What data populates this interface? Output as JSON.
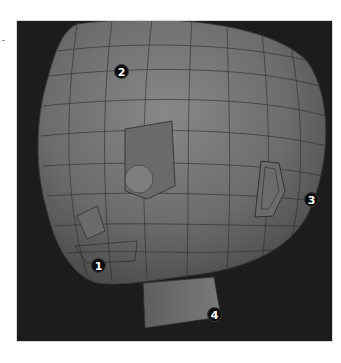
{
  "figure": {
    "background_color": "#1c1c1c",
    "mesh_color": "#6e6e6e",
    "wire_color": "#2a2a2a",
    "callouts": [
      {
        "label": "1",
        "x": 90,
        "y": 256
      },
      {
        "label": "2",
        "x": 113,
        "y": 62
      },
      {
        "label": "3",
        "x": 303,
        "y": 190
      },
      {
        "label": "4",
        "x": 206,
        "y": 305
      }
    ]
  }
}
